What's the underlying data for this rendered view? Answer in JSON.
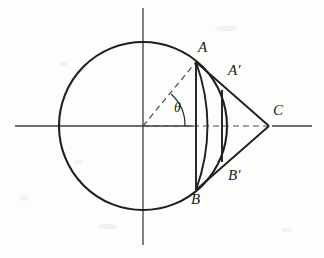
{
  "figure": {
    "background_color": "#fdfdfc",
    "stroke_color": "#1f1f1f",
    "axis_color": "#3a3a3a",
    "dash_color": "#4a4a4a"
  },
  "geometry": {
    "circle": {
      "cx": 143,
      "cy": 126,
      "r": 84
    },
    "x_axis": {
      "x1": 15,
      "y1": 126,
      "x2": 312,
      "y2": 126
    },
    "y_axis": {
      "x1": 143,
      "y1": 8,
      "x2": 143,
      "y2": 245
    },
    "point_A": {
      "x": 196,
      "y": 62
    },
    "point_B": {
      "x": 196,
      "y": 190
    },
    "point_A_prime": {
      "x": 222,
      "y": 90
    },
    "point_B_prime": {
      "x": 222,
      "y": 162
    },
    "point_C": {
      "x": 269,
      "y": 126
    },
    "center": {
      "x": 143,
      "y": 126
    },
    "chord_AB": {
      "x1": 196,
      "y1": 62,
      "x2": 196,
      "y2": 190
    },
    "arc_AB_bulge_x": 213,
    "radius_dash_to_A": {
      "x1": 143,
      "y1": 126,
      "x2": 196,
      "y2": 62
    },
    "axis_dash_to_C": {
      "x1": 143,
      "y1": 126,
      "x2": 269,
      "y2": 126
    },
    "theta_arc_radius": 42
  },
  "labels": {
    "A": "A",
    "B": "B",
    "A_prime": "A′",
    "B_prime": "B′",
    "C": "C",
    "theta": "θ"
  },
  "label_positions": {
    "A": {
      "left": 198,
      "top": 40
    },
    "B": {
      "left": 191,
      "top": 192
    },
    "A_prime": {
      "left": 228,
      "top": 63
    },
    "B_prime": {
      "left": 228,
      "top": 168
    },
    "C": {
      "left": 273,
      "top": 103
    },
    "theta": {
      "left": 174,
      "top": 101
    }
  }
}
